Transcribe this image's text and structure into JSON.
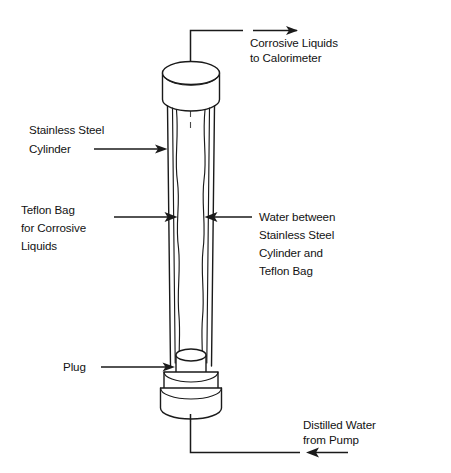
{
  "figure": {
    "background_color": "#ffffff",
    "line_color": "#1a1a1a",
    "text_color": "#121212"
  },
  "labels": {
    "corrosive_out": {
      "name": "corrosive-liquids-to-calorimeter",
      "lines": [
        "Corrosive Liquids",
        "to Calorimeter"
      ],
      "arrow_direction": "right"
    },
    "stainless_cylinder": {
      "name": "stainless-steel-cylinder",
      "lines": [
        "Stainless Steel",
        "Cylinder"
      ],
      "arrow_direction": "right"
    },
    "teflon_bag": {
      "name": "teflon-bag-for-corrosive-liquids",
      "lines": [
        "Teflon Bag",
        "for Corrosive",
        "Liquids"
      ],
      "arrow_direction": "right"
    },
    "water_between": {
      "name": "water-between-cylinder-and-bag",
      "lines": [
        "Water between",
        "Stainless Steel",
        "Cylinder and",
        "Teflon Bag"
      ],
      "arrow_direction": "left"
    },
    "plug": {
      "name": "plug",
      "lines": [
        "Plug"
      ],
      "arrow_direction": "right"
    },
    "distilled_water": {
      "name": "distilled-water-from-pump",
      "lines": [
        "Distilled Water",
        "from Pump"
      ],
      "arrow_direction": "left"
    }
  },
  "parts": {
    "top_cap": "top-cap-cylinder",
    "body": "cylinder-body",
    "teflon_wall": "teflon-bag-wall",
    "plug_body": "plug-cylinder",
    "base_ring": "base-ring",
    "base_disc": "base-disc",
    "outlet_pipe": "outlet-pipe",
    "inlet_pipe": "inlet-pipe",
    "centerline": "center-axis-dashed-line"
  }
}
